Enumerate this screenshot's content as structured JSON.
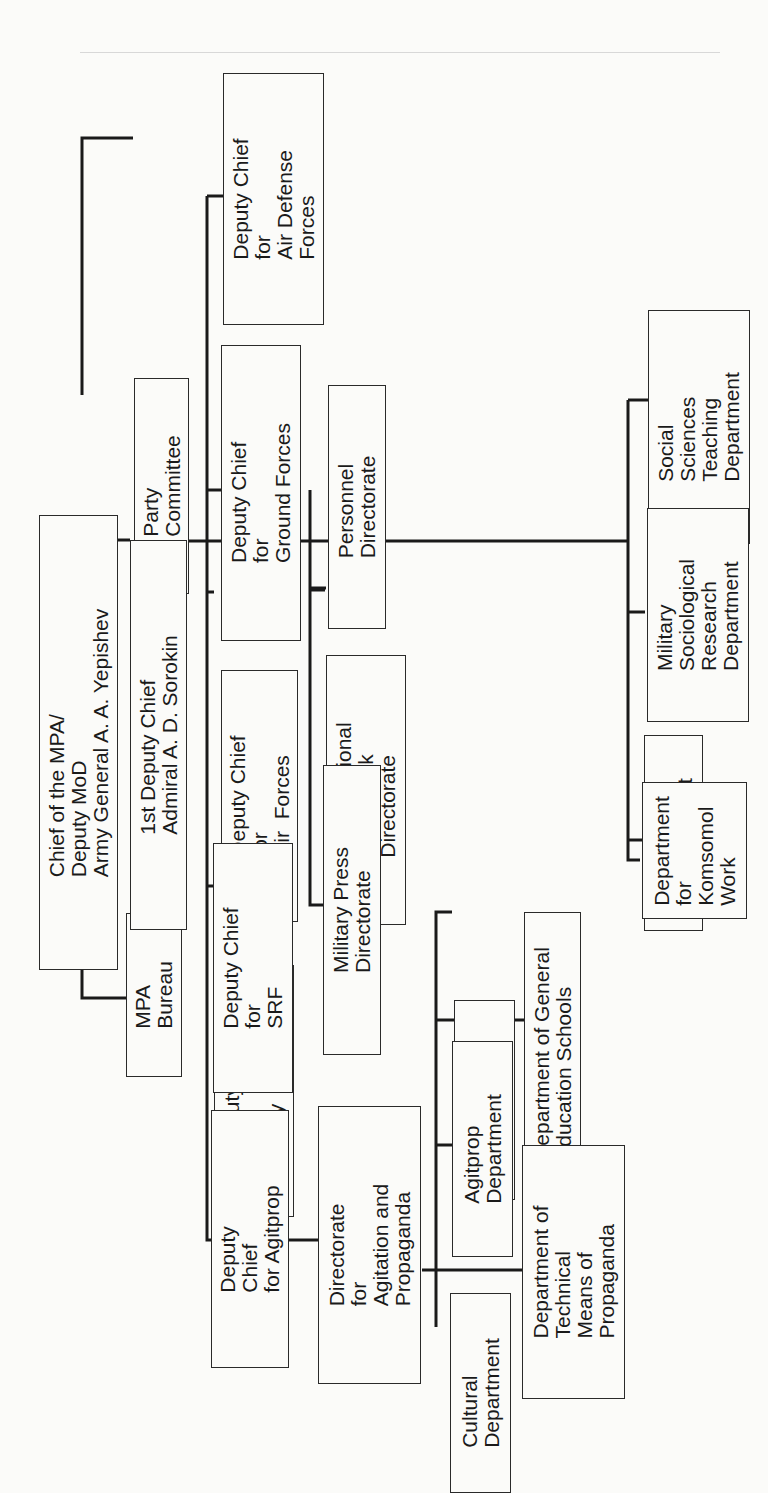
{
  "diagram": {
    "type": "organization-chart",
    "orientation": "rotated-90-ccw",
    "line_color": "#1a1a1a",
    "nodes": {
      "chief": {
        "label": "Chief of the MPA/\nDeputy MoD\nArmy General A. A. Yepishev"
      },
      "party_committee": {
        "label": "Party\nCommittee"
      },
      "mpa_bureau": {
        "label": "MPA\nBureau"
      },
      "first_deputy": {
        "label": "1st Deputy Chief\nAdmiral A. D. Sorokin"
      },
      "dc_air_defense": {
        "label": "Deputy Chief\nfor\nAir Defense\nForces"
      },
      "dc_ground": {
        "label": "Deputy Chief\nfor\nGround Forces"
      },
      "dc_air": {
        "label": "Deputy Chief\nfor\nAir  Forces"
      },
      "dc_navy": {
        "label": "Deputy Chief\nfor\nNavy"
      },
      "dc_srf": {
        "label": "Deputy Chief\nfor\nSRF"
      },
      "dc_agitprop": {
        "label": "Deputy\nChief\nfor Agitprop"
      },
      "personnel": {
        "label": "Personnel\nDirectorate"
      },
      "org_party_work": {
        "label": "Organizational\nParty Work\nDirectorate"
      },
      "military_press": {
        "label": "Military Press\nDirectorate"
      },
      "dir_agitprop": {
        "label": "Directorate\nfor\nAgitation and\nPropaganda"
      },
      "lecture": {
        "label": "Lecture\nDepartment"
      },
      "gen_education": {
        "label": "Department of General\nEducation Schools"
      },
      "agitprop_dept": {
        "label": "Agitprop\nDepartment"
      },
      "technical_means": {
        "label": "Department of\nTechnical\nMeans of\nPropaganda"
      },
      "cultural": {
        "label": "Cultural\nDepartment"
      },
      "social_sciences": {
        "label": "Social\nSciences\nTeaching\nDepartment"
      },
      "sociological": {
        "label": "Military\nSociological\nResearch\nDepartment"
      },
      "finance": {
        "label": "Finance\nDepartment"
      },
      "komsomol": {
        "label": "Department\nfor\nKomsomol\nWork"
      }
    },
    "edges": [
      [
        "chief",
        "party_committee"
      ],
      [
        "chief",
        "mpa_bureau"
      ],
      [
        "chief",
        "first_deputy"
      ],
      [
        "first_deputy",
        "dc_air_defense"
      ],
      [
        "first_deputy",
        "dc_ground"
      ],
      [
        "first_deputy",
        "dc_air"
      ],
      [
        "first_deputy",
        "dc_navy"
      ],
      [
        "first_deputy",
        "dc_srf"
      ],
      [
        "first_deputy",
        "dc_agitprop"
      ],
      [
        "first_deputy",
        "personnel"
      ],
      [
        "first_deputy",
        "org_party_work"
      ],
      [
        "first_deputy",
        "military_press"
      ],
      [
        "first_deputy",
        "social_sciences"
      ],
      [
        "first_deputy",
        "sociological"
      ],
      [
        "first_deputy",
        "finance"
      ],
      [
        "first_deputy",
        "komsomol"
      ],
      [
        "dc_agitprop",
        "dir_agitprop"
      ],
      [
        "dir_agitprop",
        "lecture"
      ],
      [
        "dir_agitprop",
        "gen_education"
      ],
      [
        "dir_agitprop",
        "agitprop_dept"
      ],
      [
        "dir_agitprop",
        "technical_means"
      ],
      [
        "dir_agitprop",
        "cultural"
      ]
    ]
  }
}
